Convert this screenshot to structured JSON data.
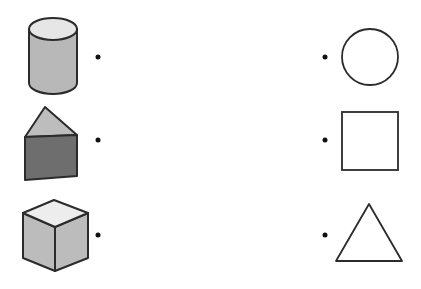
{
  "colors": {
    "stroke": "#2b2b2b",
    "cylinder_side": "#b8b8b8",
    "cylinder_top": "#e6e6e6",
    "prism_top": "#bdbdbd",
    "prism_front": "#6e6e6e",
    "cube_top": "#ededed",
    "cube_side": "#bcbcbc",
    "background": "#ffffff"
  },
  "left_items": [
    {
      "shape": "cylinder",
      "label": "cylinder"
    },
    {
      "shape": "triangular-prism",
      "label": "triangular prism"
    },
    {
      "shape": "cube",
      "label": "cube"
    }
  ],
  "right_items": [
    {
      "shape": "circle",
      "label": "circle"
    },
    {
      "shape": "square",
      "label": "square"
    },
    {
      "shape": "triangle",
      "label": "triangle"
    }
  ]
}
